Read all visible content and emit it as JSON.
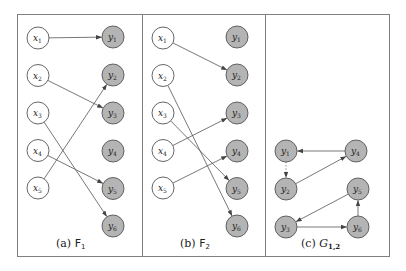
{
  "figure": {
    "border_color": "#808080",
    "node_fill_x": "#ffffff",
    "node_fill_y": "#b4b4b4",
    "edge_color": "#555555",
    "panels": [
      {
        "id": "a",
        "caption_prefix": "(a) ",
        "caption_symbol": "F",
        "caption_sub": "1",
        "x_nodes": [
          {
            "name": "x",
            "sub": "1"
          },
          {
            "name": "x",
            "sub": "2"
          },
          {
            "name": "x",
            "sub": "3"
          },
          {
            "name": "x",
            "sub": "4"
          },
          {
            "name": "x",
            "sub": "5"
          }
        ],
        "y_nodes": [
          {
            "name": "y",
            "sub": "1"
          },
          {
            "name": "y",
            "sub": "2"
          },
          {
            "name": "y",
            "sub": "3"
          },
          {
            "name": "y",
            "sub": "4"
          },
          {
            "name": "y",
            "sub": "5"
          },
          {
            "name": "y",
            "sub": "6"
          }
        ],
        "edges": [
          {
            "from": "x1",
            "to": "y1"
          },
          {
            "from": "x2",
            "to": "y3"
          },
          {
            "from": "x3",
            "to": "y6"
          },
          {
            "from": "x4",
            "to": "y5"
          },
          {
            "from": "x5",
            "to": "y2"
          }
        ]
      },
      {
        "id": "b",
        "caption_prefix": "(b) ",
        "caption_symbol": "F",
        "caption_sub": "2",
        "x_nodes": [
          {
            "name": "x",
            "sub": "1"
          },
          {
            "name": "x",
            "sub": "2"
          },
          {
            "name": "x",
            "sub": "3"
          },
          {
            "name": "x",
            "sub": "4"
          },
          {
            "name": "x",
            "sub": "5"
          }
        ],
        "y_nodes": [
          {
            "name": "y",
            "sub": "1"
          },
          {
            "name": "y",
            "sub": "2"
          },
          {
            "name": "y",
            "sub": "3"
          },
          {
            "name": "y",
            "sub": "4"
          },
          {
            "name": "y",
            "sub": "5"
          },
          {
            "name": "y",
            "sub": "6"
          }
        ],
        "edges": [
          {
            "from": "x1",
            "to": "y2"
          },
          {
            "from": "x2",
            "to": "y6"
          },
          {
            "from": "x3",
            "to": "y5"
          },
          {
            "from": "x4",
            "to": "y3"
          },
          {
            "from": "x5",
            "to": "y4"
          }
        ]
      },
      {
        "id": "c",
        "caption_prefix": "(c) ",
        "caption_symbol": "G",
        "caption_sub": "1,2",
        "nodes": [
          {
            "id": "y1",
            "name": "y",
            "sub": "1"
          },
          {
            "id": "y4",
            "name": "y",
            "sub": "4"
          },
          {
            "id": "y2",
            "name": "y",
            "sub": "2"
          },
          {
            "id": "y5",
            "name": "y",
            "sub": "5"
          },
          {
            "id": "y3",
            "name": "y",
            "sub": "3"
          },
          {
            "id": "y6",
            "name": "y",
            "sub": "6"
          }
        ],
        "edges": [
          {
            "from": "y4",
            "to": "y1",
            "style": "solid"
          },
          {
            "from": "y1",
            "to": "y2",
            "style": "dotted"
          },
          {
            "from": "y2",
            "to": "y4",
            "style": "solid"
          },
          {
            "from": "y5",
            "to": "y3",
            "style": "solid"
          },
          {
            "from": "y3",
            "to": "y6",
            "style": "solid"
          },
          {
            "from": "y6",
            "to": "y5",
            "style": "solid"
          }
        ]
      }
    ]
  }
}
